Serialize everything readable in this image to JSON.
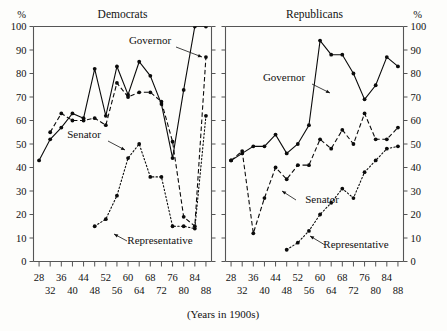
{
  "figure": {
    "y_axis_unit_left": "%",
    "y_axis_unit_right": "%",
    "x_caption": "(Years in 1900s)"
  },
  "panels": [
    {
      "title": "Democrats"
    },
    {
      "title": "Republicans"
    }
  ],
  "series_labels": {
    "governor": "Governor",
    "senator": "Senator",
    "representative": "Representative"
  },
  "chart_data": {
    "type": "line",
    "title": "",
    "subtitle": "",
    "xlabel": "(Years in 1900s)",
    "ylabel": "%",
    "xlim": [
      26,
      90
    ],
    "ylim": [
      0,
      100
    ],
    "ytick_labels": [
      "0",
      "10",
      "20",
      "30",
      "40",
      "50",
      "60",
      "70",
      "80",
      "90",
      "100"
    ],
    "ytick_values": [
      0,
      10,
      20,
      30,
      40,
      50,
      60,
      70,
      80,
      90,
      100
    ],
    "xtick_values": [
      28,
      32,
      36,
      40,
      44,
      48,
      52,
      56,
      60,
      64,
      68,
      72,
      76,
      80,
      84,
      88
    ],
    "xtick_labels": [
      "28",
      "32",
      "36",
      "40",
      "44",
      "48",
      "52",
      "56",
      "60",
      "64",
      "68",
      "72",
      "76",
      "80",
      "84",
      "88"
    ],
    "xtick_label_rows": "alternating: 28,36,44,52,60,68,76,84 on upper row; 32,40,48,56,64,72,80,88 on lower row",
    "grid": false,
    "legend": "inline annotations with leader lines",
    "panels": [
      {
        "name": "Democrats",
        "series": [
          {
            "name": "Governor",
            "style": "solid",
            "x": [
              28,
              32,
              36,
              40,
              44,
              48,
              52,
              56,
              60,
              64,
              68,
              72,
              76,
              80,
              84,
              88
            ],
            "values": [
              43,
              52,
              57,
              63,
              61,
              82,
              62,
              83,
              71,
              85,
              79,
              67,
              44,
              73,
              100,
              100
            ]
          },
          {
            "name": "Senator",
            "style": "dashed",
            "x": [
              32,
              36,
              40,
              44,
              48,
              52,
              56,
              60,
              64,
              68,
              72,
              76,
              80,
              84,
              88
            ],
            "values": [
              55,
              63,
              60,
              60,
              61,
              58,
              76,
              70,
              72,
              72,
              68,
              51,
              19,
              15,
              87
            ]
          },
          {
            "name": "Representative",
            "style": "dotted",
            "x": [
              48,
              52,
              56,
              60,
              64,
              68,
              72,
              76,
              80,
              84,
              88
            ],
            "values": [
              15,
              18,
              28,
              44,
              50,
              36,
              36,
              15,
              15,
              14,
              62
            ]
          }
        ]
      },
      {
        "name": "Republicans",
        "series": [
          {
            "name": "Governor",
            "style": "solid",
            "x": [
              28,
              32,
              36,
              40,
              44,
              48,
              52,
              56,
              60,
              64,
              68,
              72,
              76,
              80,
              84,
              88
            ],
            "values": [
              43,
              46,
              49,
              49,
              54,
              46,
              50,
              58,
              94,
              88,
              88,
              80,
              69,
              75,
              87,
              83
            ]
          },
          {
            "name": "Senator",
            "style": "dashed",
            "x": [
              28,
              32,
              36,
              40,
              44,
              48,
              52,
              56,
              60,
              64,
              68,
              72,
              76,
              80,
              84,
              88
            ],
            "values": [
              43,
              47,
              12,
              27,
              40,
              35,
              41,
              41,
              52,
              48,
              56,
              50,
              63,
              52,
              52,
              57
            ]
          },
          {
            "name": "Representative",
            "style": "dotted",
            "x": [
              48,
              52,
              56,
              60,
              64,
              68,
              72,
              76,
              80,
              84,
              88
            ],
            "values": [
              5,
              8,
              13,
              20,
              25,
              31,
              27,
              38,
              43,
              48,
              49
            ]
          }
        ]
      }
    ]
  }
}
